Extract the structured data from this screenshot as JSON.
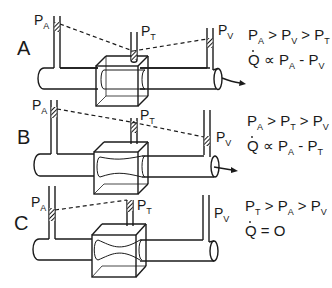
{
  "diagram": {
    "panels": [
      {
        "id": "A",
        "label": "A",
        "gauges": {
          "left": "P",
          "left_sub": "A",
          "middle": "P",
          "middle_sub": "T",
          "right": "P",
          "right_sub": "V"
        },
        "relation_line1": {
          "parts": [
            "P",
            "A",
            " > ",
            "P",
            "V",
            " > ",
            "P",
            "T"
          ]
        },
        "relation_line2": {
          "q": "Q",
          "op": " ∝ ",
          "a": "P",
          "a_sub": "A",
          "minus": " - ",
          "b": "P",
          "b_sub": "V"
        },
        "constriction": "none",
        "flow": "outflow"
      },
      {
        "id": "B",
        "label": "B",
        "gauges": {
          "left": "P",
          "left_sub": "A",
          "middle": "P",
          "middle_sub": "T",
          "right": "P",
          "right_sub": "V"
        },
        "relation_line1": {
          "parts": [
            "P",
            "A",
            " > ",
            "P",
            "T",
            " > ",
            "P",
            "V"
          ]
        },
        "relation_line2": {
          "q": "Q",
          "op": " ∝ ",
          "a": "P",
          "a_sub": "A",
          "minus": " - ",
          "b": "P",
          "b_sub": "T"
        },
        "constriction": "partial",
        "flow": "outflow"
      },
      {
        "id": "C",
        "label": "C",
        "gauges": {
          "left": "P",
          "left_sub": "A",
          "middle": "P",
          "middle_sub": "T",
          "right": "P",
          "right_sub": "V"
        },
        "relation_line1": {
          "parts": [
            "P",
            "T",
            " > ",
            "P",
            "A",
            " > ",
            "P",
            "V"
          ]
        },
        "relation_line2": {
          "q": "Q",
          "eq": " = ",
          "value": "O"
        },
        "constriction": "collapsed",
        "flow": "none"
      }
    ],
    "colors": {
      "ink": "#1a1a1a",
      "background": "#ffffff"
    }
  }
}
